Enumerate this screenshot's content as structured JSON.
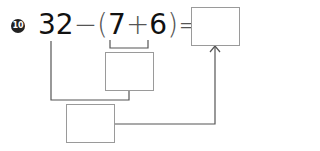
{
  "problem": {
    "number": "10",
    "a": "32",
    "minus": "−",
    "open_paren": "(",
    "b": "7",
    "plus": "+",
    "c": "6",
    "close_paren": ")",
    "equals": "=",
    "answer_box": "",
    "intermediate_box": "",
    "working_box": ""
  }
}
